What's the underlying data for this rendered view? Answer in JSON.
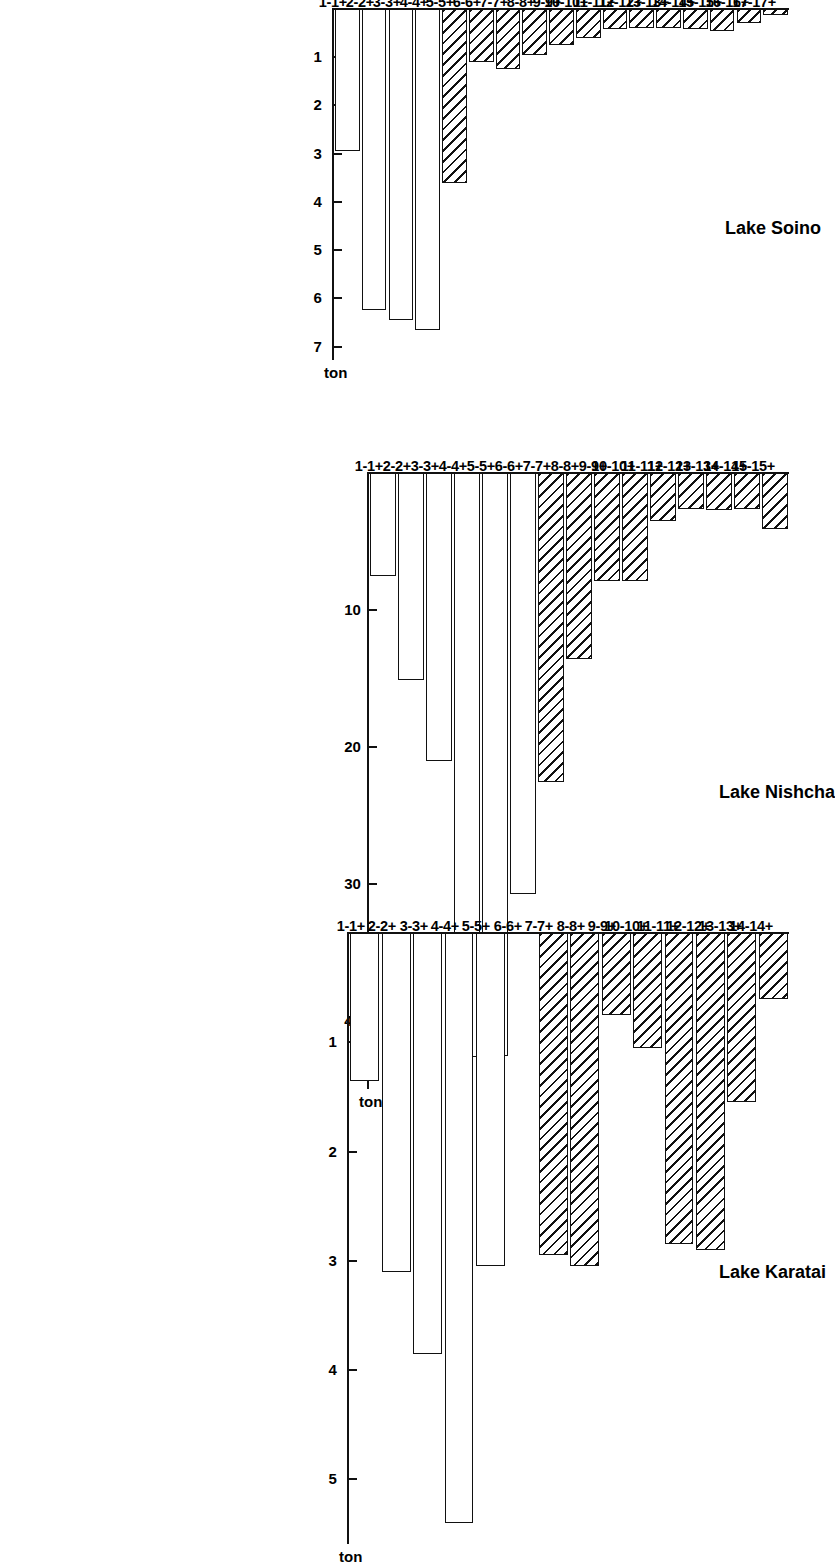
{
  "figure": {
    "orientation": "rotated-90-clockwise",
    "unit_label": "ton",
    "panel_count": 3
  },
  "chart_data": [
    {
      "type": "bar",
      "title": "Lake Karatai",
      "xlabel": "",
      "ylabel": "ton",
      "ylim": [
        0,
        5.6
      ],
      "grid": false,
      "legend": "none",
      "orientation": "horizontal",
      "categories": [
        "1-1+",
        "2-2+",
        "3-3+",
        "4-4+",
        "5-5+",
        "6-6+",
        "7-7+",
        "8-8+",
        "9-9+",
        "10-10+",
        "11-11+",
        "12-12+",
        "13-13+",
        "14-14+"
      ],
      "values": [
        1.35,
        3.1,
        3.85,
        5.4,
        3.05,
        0.0,
        2.95,
        3.05,
        0.75,
        1.05,
        2.85,
        2.9,
        1.55,
        0.6
      ],
      "hatched": [
        false,
        false,
        false,
        false,
        false,
        false,
        true,
        true,
        true,
        true,
        true,
        true,
        true,
        true
      ],
      "ticks": [
        5,
        4,
        3,
        2,
        1
      ]
    },
    {
      "type": "bar",
      "title": "Lake Nishcha",
      "xlabel": "",
      "ylabel": "ton",
      "ylim": [
        0,
        45
      ],
      "grid": false,
      "legend": "none",
      "orientation": "horizontal",
      "categories": [
        "1-1+",
        "2-2+",
        "3-3+",
        "4-4+",
        "5-5+",
        "6-6+",
        "7-7+",
        "8-8+",
        "9-9+",
        "10-10+",
        "11-11+",
        "12-12+",
        "13-13+",
        "14-14+",
        "15-15+"
      ],
      "values": [
        7.5,
        15.1,
        21.0,
        42.6,
        42.5,
        30.7,
        22.5,
        13.6,
        7.9,
        7.9,
        3.5,
        2.6,
        2.7,
        2.6,
        4.1
      ],
      "hatched": [
        false,
        false,
        false,
        false,
        false,
        false,
        true,
        true,
        true,
        true,
        true,
        true,
        true,
        true,
        true
      ],
      "ticks": [
        40,
        30,
        20,
        10
      ]
    },
    {
      "type": "bar",
      "title": "Lake Soino",
      "xlabel": "",
      "ylabel": "ton",
      "ylim": [
        0,
        7.3
      ],
      "grid": false,
      "legend": "none",
      "orientation": "horizontal",
      "categories": [
        "1-1+",
        "2-2+",
        "3-3+",
        "4-4+",
        "5-5+",
        "6-6+",
        "7-7+",
        "8-8+",
        "9-9+",
        "10-10+",
        "11-11+",
        "12-12+",
        "13-13+",
        "14-14+",
        "15-15+",
        "16-16+",
        "17-17+"
      ],
      "values": [
        2.95,
        6.25,
        6.45,
        6.65,
        3.6,
        1.1,
        1.25,
        0.95,
        0.75,
        0.6,
        0.42,
        0.4,
        0.4,
        0.42,
        0.45,
        0.3,
        0.12
      ],
      "hatched": [
        false,
        false,
        false,
        false,
        true,
        true,
        true,
        true,
        true,
        true,
        true,
        true,
        true,
        true,
        true,
        true,
        true
      ],
      "ticks": [
        7,
        6,
        5,
        4,
        3,
        2,
        1
      ]
    }
  ]
}
